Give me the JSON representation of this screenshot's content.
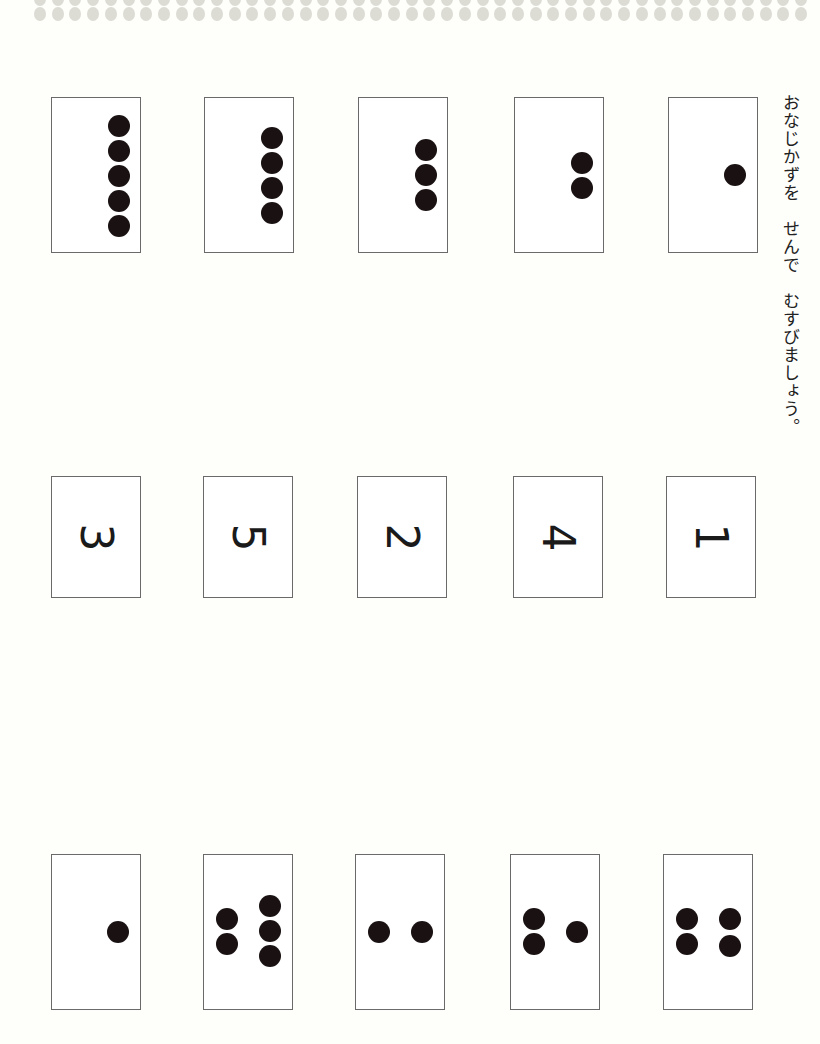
{
  "worksheet": {
    "instruction": "おなじかずを　せんで　むすびましょう。",
    "top_row": [
      {
        "count": 5,
        "x": 51
      },
      {
        "count": 4,
        "x": 204
      },
      {
        "count": 3,
        "x": 358
      },
      {
        "count": 2,
        "x": 514
      },
      {
        "count": 1,
        "x": 668
      }
    ],
    "middle_row": [
      {
        "label": "3",
        "x": 51
      },
      {
        "label": "5",
        "x": 203
      },
      {
        "label": "2",
        "x": 357
      },
      {
        "label": "4",
        "x": 513
      },
      {
        "label": "1",
        "x": 666
      }
    ],
    "bottom_row": [
      {
        "count": 1,
        "x": 51
      },
      {
        "count": 5,
        "x": 203
      },
      {
        "count": 2,
        "x": 355
      },
      {
        "count": 3,
        "x": 510
      },
      {
        "count": 4,
        "x": 663
      }
    ]
  },
  "colors": {
    "dot": "#1a1212",
    "card_border": "#6a6a6a",
    "band_dot": "#dcdcd4",
    "background": "#fefefb"
  }
}
